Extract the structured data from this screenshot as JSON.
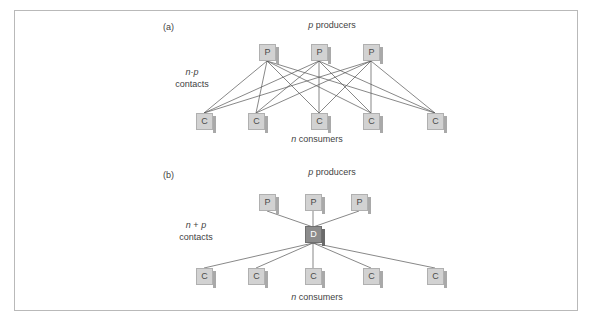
{
  "figure": {
    "background_color": "#ffffff",
    "frame_color": "#b9b9b9",
    "node_fill": "#d2d2d2",
    "node_edge": "#b0b0b0",
    "hub_fill": "#8c8c8c",
    "line_color": "#555555"
  },
  "panels": [
    {
      "tag": "(a)",
      "top_label_italic": "p",
      "top_label_rest": " producers",
      "bottom_label_italic": "n",
      "bottom_label_rest": " consumers",
      "side_label_line1_a": "n",
      "side_label_line1_op": "·",
      "side_label_line1_b": "p",
      "side_label_line2": "contacts",
      "producers": [
        {
          "label": "P"
        },
        {
          "label": "P"
        },
        {
          "label": "P"
        }
      ],
      "consumers": [
        {
          "label": "C"
        },
        {
          "label": "C"
        },
        {
          "label": "C"
        },
        {
          "label": "C"
        },
        {
          "label": "C"
        }
      ],
      "topology": "full-bipartite",
      "edge_count": 15
    },
    {
      "tag": "(b)",
      "top_label_italic": "p",
      "top_label_rest": " producers",
      "bottom_label_italic": "n",
      "bottom_label_rest": " consumers",
      "side_label_line1_a": "n",
      "side_label_line1_op": " + ",
      "side_label_line1_b": "p",
      "side_label_line2": "contacts",
      "producers": [
        {
          "label": "P"
        },
        {
          "label": "P"
        },
        {
          "label": "P"
        }
      ],
      "hub": {
        "label": "D"
      },
      "consumers": [
        {
          "label": "C"
        },
        {
          "label": "C"
        },
        {
          "label": "C"
        },
        {
          "label": "C"
        },
        {
          "label": "C"
        }
      ],
      "topology": "star-via-hub",
      "edge_count": 8
    }
  ]
}
